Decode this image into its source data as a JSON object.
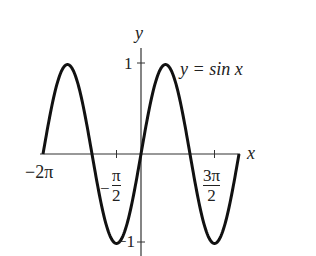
{
  "chart_data": {
    "type": "line",
    "title": "",
    "function": "y = sin x",
    "annotation": "y = sin x",
    "xlabel": "x",
    "ylabel": "y",
    "xlim": [
      -6.2832,
      6.2832
    ],
    "ylim": [
      -1,
      1
    ],
    "grid": false,
    "legend": "none",
    "x_ticks": [
      {
        "value": -6.2832,
        "label": "−2π"
      },
      {
        "value": -1.5708,
        "label": "−π/2"
      },
      {
        "value": 4.7124,
        "label": "3π/2"
      }
    ],
    "y_ticks": [
      {
        "value": 1,
        "label": "1"
      },
      {
        "value": -1,
        "label": "−1"
      }
    ],
    "series": [
      {
        "name": "y = sin x",
        "x": [
          -6.2832,
          -4.7124,
          -3.1416,
          -1.5708,
          0,
          1.5708,
          3.1416,
          4.7124,
          6.2832
        ],
        "values": [
          0,
          1,
          0,
          -1,
          0,
          1,
          0,
          -1,
          0
        ]
      }
    ],
    "color": "#111111"
  },
  "labels": {
    "x_axis": "x",
    "y_axis": "y",
    "curve": "y = sin x",
    "tick_neg_2pi": "−2π",
    "tick_neg_half_pi_sign": "−",
    "tick_neg_half_pi_num": "π",
    "tick_neg_half_pi_den": "2",
    "tick_3half_pi_num": "3π",
    "tick_3half_pi_den": "2",
    "tick_y_pos1": "1",
    "tick_y_neg1": "−1"
  }
}
